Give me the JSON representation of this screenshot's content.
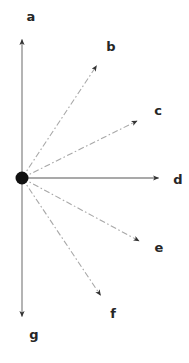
{
  "figure": {
    "width": 189,
    "height": 363,
    "background_color": "#ffffff"
  },
  "origin": {
    "label": "origin-point",
    "x": 22,
    "y": 178,
    "radius": 6.5,
    "color": "#111111"
  },
  "colors": {
    "axis": "#8c8c8c",
    "dashed_ray": "#a8a8a8",
    "arrowhead": "#333333",
    "label_text": "#262626",
    "origin_dot": "#111111"
  },
  "chart_data": {
    "type": "scatter",
    "title": "",
    "xlabel": "",
    "ylabel": "",
    "grid": false,
    "legend": false,
    "origin": [
      22,
      178
    ],
    "rays": [
      {
        "label": "a",
        "style": "solid",
        "tip_x": 22,
        "tip_y": 35,
        "label_x": 31,
        "label_y": 16,
        "angle_deg": 90,
        "length_px": 143
      },
      {
        "label": "b",
        "style": "dash-dot",
        "tip_x": 99,
        "tip_y": 62,
        "label_x": 111,
        "label_y": 46,
        "angle_deg": 56,
        "length_px": 138
      },
      {
        "label": "c",
        "style": "dash-dot",
        "tip_x": 141,
        "tip_y": 119,
        "label_x": 158,
        "label_y": 110,
        "angle_deg": 26,
        "length_px": 132
      },
      {
        "label": "d",
        "style": "solid",
        "tip_x": 163,
        "tip_y": 178,
        "label_x": 178,
        "label_y": 179,
        "angle_deg": 0,
        "length_px": 141
      },
      {
        "label": "e",
        "style": "dash-dot",
        "tip_x": 143,
        "tip_y": 243,
        "label_x": 159,
        "label_y": 247,
        "angle_deg": -31,
        "length_px": 141
      },
      {
        "label": "f",
        "style": "dash-dot",
        "tip_x": 103,
        "tip_y": 299,
        "label_x": 113,
        "label_y": 313,
        "angle_deg": -59,
        "length_px": 157
      },
      {
        "label": "g",
        "style": "solid",
        "tip_x": 22,
        "tip_y": 321,
        "label_x": 34,
        "label_y": 334,
        "angle_deg": -90,
        "length_px": 143
      }
    ]
  }
}
